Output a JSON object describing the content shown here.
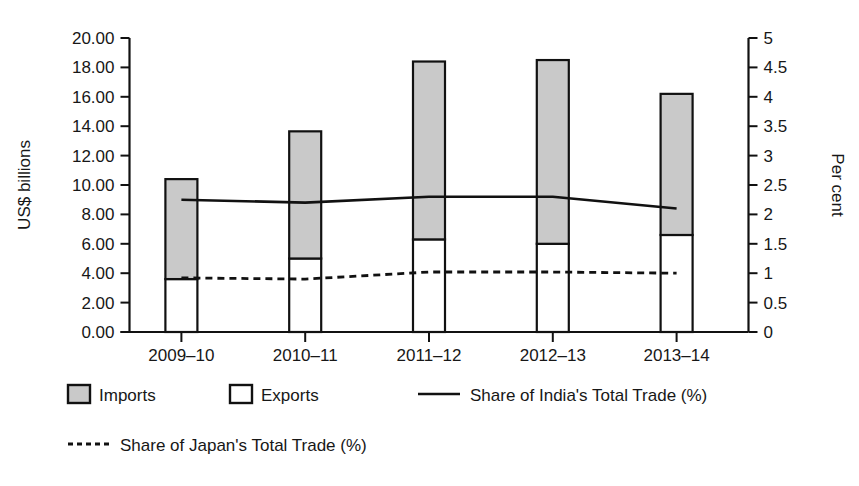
{
  "chart_data": {
    "type": "bar",
    "title": "",
    "subtitle": "",
    "xlabel": "",
    "ylabel": "US$ billions",
    "y2label": "Per cent",
    "categories": [
      "2009–10",
      "2010–11",
      "2011–12",
      "2012–13",
      "2013–14"
    ],
    "ylim": [
      0,
      20
    ],
    "y2lim": [
      0,
      5
    ],
    "yticks": [
      "0.00",
      "2.00",
      "4.00",
      "6.00",
      "8.00",
      "10.00",
      "12.00",
      "14.00",
      "16.00",
      "18.00",
      "20.00"
    ],
    "ytick_values": [
      0,
      2,
      4,
      6,
      8,
      10,
      12,
      14,
      16,
      18,
      20
    ],
    "y2ticks": [
      "0",
      "0.5",
      "1",
      "1.5",
      "2",
      "2.5",
      "3",
      "3.5",
      "4",
      "4.5",
      "5"
    ],
    "y2tick_values": [
      0,
      0.5,
      1,
      1.5,
      2,
      2.5,
      3,
      3.5,
      4,
      4.5,
      5
    ],
    "grid": false,
    "legend_position": "bottom",
    "stacked": true,
    "series": [
      {
        "name": "Exports",
        "kind": "bar-segment",
        "axis": "left",
        "fill": "#ffffff",
        "values": [
          3.6,
          5.0,
          6.3,
          6.0,
          6.6
        ]
      },
      {
        "name": "Imports",
        "kind": "bar-segment",
        "axis": "left",
        "fill": "#c9c9c9",
        "values": [
          6.8,
          8.65,
          12.1,
          12.5,
          9.6
        ]
      },
      {
        "name": "Total (Exports + Imports)",
        "kind": "bar-total",
        "axis": "left",
        "values": [
          10.4,
          13.65,
          18.4,
          18.5,
          16.2
        ]
      },
      {
        "name": "Share of India's Total Trade (%)",
        "kind": "line",
        "style": "solid",
        "axis": "right",
        "values": [
          2.25,
          2.2,
          2.3,
          2.3,
          2.1
        ]
      },
      {
        "name": "Share of Japan's Total Trade (%)",
        "kind": "line",
        "style": "dotted",
        "axis": "right",
        "values": [
          0.92,
          0.9,
          1.02,
          1.02,
          1.0
        ]
      }
    ]
  },
  "legend": {
    "items": [
      {
        "label": "Imports",
        "marker": "swatch-gray"
      },
      {
        "label": "Exports",
        "marker": "swatch-white"
      },
      {
        "label": "Share of India's Total Trade (%)",
        "marker": "line-solid"
      },
      {
        "label": "Share of Japan's Total Trade (%)",
        "marker": "line-dotted"
      }
    ]
  },
  "colors": {
    "imports_fill": "#c9c9c9",
    "exports_fill": "#ffffff",
    "line": "#111111",
    "axis": "#111111",
    "text": "#171717",
    "background": "#ffffff"
  }
}
